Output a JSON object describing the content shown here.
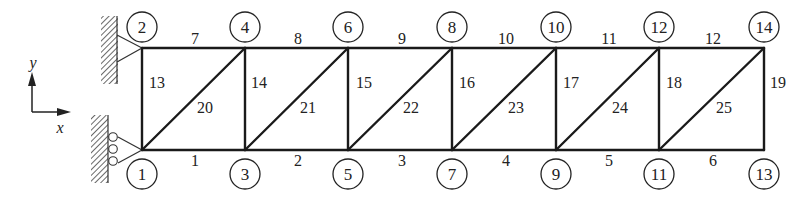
{
  "diagram": {
    "type": "truss",
    "axes": {
      "x_label": "x",
      "y_label": "y"
    },
    "nodes": [
      {
        "id": "1",
        "x": 142,
        "y": 150,
        "label_x": 142,
        "label_y": 174
      },
      {
        "id": "2",
        "x": 142,
        "y": 48,
        "label_x": 142,
        "label_y": 27
      },
      {
        "id": "3",
        "x": 245,
        "y": 150,
        "label_x": 245,
        "label_y": 174
      },
      {
        "id": "4",
        "x": 245,
        "y": 48,
        "label_x": 245,
        "label_y": 27
      },
      {
        "id": "5",
        "x": 348,
        "y": 150,
        "label_x": 348,
        "label_y": 174
      },
      {
        "id": "6",
        "x": 348,
        "y": 48,
        "label_x": 348,
        "label_y": 27
      },
      {
        "id": "7",
        "x": 452,
        "y": 150,
        "label_x": 452,
        "label_y": 174
      },
      {
        "id": "8",
        "x": 452,
        "y": 48,
        "label_x": 452,
        "label_y": 27
      },
      {
        "id": "9",
        "x": 556,
        "y": 150,
        "label_x": 556,
        "label_y": 174
      },
      {
        "id": "10",
        "x": 556,
        "y": 48,
        "label_x": 556,
        "label_y": 27
      },
      {
        "id": "11",
        "x": 659,
        "y": 150,
        "label_x": 659,
        "label_y": 174
      },
      {
        "id": "12",
        "x": 659,
        "y": 48,
        "label_x": 659,
        "label_y": 27
      },
      {
        "id": "13",
        "x": 764,
        "y": 150,
        "label_x": 764,
        "label_y": 174
      },
      {
        "id": "14",
        "x": 764,
        "y": 48,
        "label_x": 764,
        "label_y": 27
      }
    ],
    "members": [
      {
        "id": "1",
        "from": "1",
        "to": "3",
        "lx": 195,
        "ly": 166
      },
      {
        "id": "2",
        "from": "3",
        "to": "5",
        "lx": 298,
        "ly": 166
      },
      {
        "id": "3",
        "from": "5",
        "to": "7",
        "lx": 402,
        "ly": 166
      },
      {
        "id": "4",
        "from": "7",
        "to": "9",
        "lx": 506,
        "ly": 166
      },
      {
        "id": "5",
        "from": "9",
        "to": "11",
        "lx": 609,
        "ly": 166
      },
      {
        "id": "6",
        "from": "11",
        "to": "13",
        "lx": 713,
        "ly": 166
      },
      {
        "id": "7",
        "from": "2",
        "to": "4",
        "lx": 195,
        "ly": 44
      },
      {
        "id": "8",
        "from": "4",
        "to": "6",
        "lx": 298,
        "ly": 44
      },
      {
        "id": "9",
        "from": "6",
        "to": "8",
        "lx": 402,
        "ly": 44
      },
      {
        "id": "10",
        "from": "8",
        "to": "10",
        "lx": 506,
        "ly": 44
      },
      {
        "id": "11",
        "from": "10",
        "to": "12",
        "lx": 609,
        "ly": 44
      },
      {
        "id": "12",
        "from": "12",
        "to": "14",
        "lx": 713,
        "ly": 44
      },
      {
        "id": "13",
        "from": "1",
        "to": "2",
        "lx": 157,
        "ly": 88
      },
      {
        "id": "14",
        "from": "3",
        "to": "4",
        "lx": 259,
        "ly": 88
      },
      {
        "id": "15",
        "from": "5",
        "to": "6",
        "lx": 364,
        "ly": 88
      },
      {
        "id": "16",
        "from": "7",
        "to": "8",
        "lx": 467,
        "ly": 88
      },
      {
        "id": "17",
        "from": "9",
        "to": "10",
        "lx": 571,
        "ly": 88
      },
      {
        "id": "18",
        "from": "11",
        "to": "12",
        "lx": 674,
        "ly": 88
      },
      {
        "id": "19",
        "from": "13",
        "to": "14",
        "lx": 778,
        "ly": 88
      },
      {
        "id": "20",
        "from": "1",
        "to": "4",
        "lx": 205,
        "ly": 113
      },
      {
        "id": "21",
        "from": "3",
        "to": "6",
        "lx": 308,
        "ly": 113
      },
      {
        "id": "22",
        "from": "5",
        "to": "8",
        "lx": 411,
        "ly": 113
      },
      {
        "id": "23",
        "from": "7",
        "to": "10",
        "lx": 516,
        "ly": 113
      },
      {
        "id": "24",
        "from": "9",
        "to": "12",
        "lx": 620,
        "ly": 113
      },
      {
        "id": "25",
        "from": "11",
        "to": "14",
        "lx": 724,
        "ly": 113
      }
    ],
    "supports": [
      {
        "node": "2",
        "type": "pin"
      },
      {
        "node": "1",
        "type": "roller"
      }
    ]
  }
}
